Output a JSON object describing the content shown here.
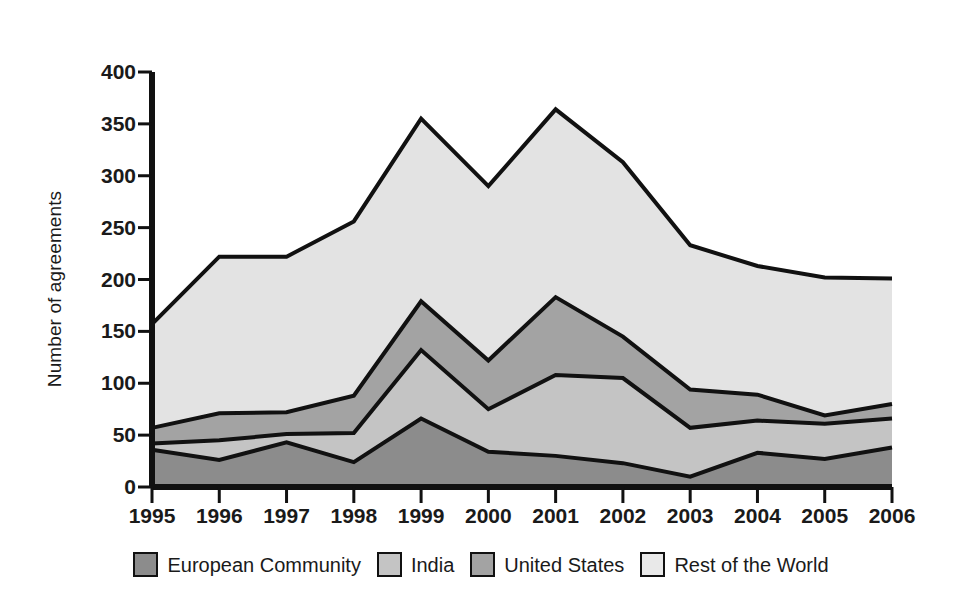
{
  "chart_data": {
    "type": "area",
    "stacked": true,
    "title": "",
    "subtitle": "",
    "xlabel": "",
    "ylabel": "Number of agreements",
    "categories": [
      "1995",
      "1996",
      "1997",
      "1998",
      "1999",
      "2000",
      "2001",
      "2002",
      "2003",
      "2004",
      "2005",
      "2006"
    ],
    "x": [
      1995,
      1996,
      1997,
      1998,
      1999,
      2000,
      2001,
      2002,
      2003,
      2004,
      2005,
      2006
    ],
    "xlim": [
      1995,
      2006
    ],
    "ylim": [
      0,
      400
    ],
    "y_ticks": [
      0,
      50,
      100,
      150,
      200,
      250,
      300,
      350,
      400
    ],
    "x_ticks": [
      1995,
      1996,
      1997,
      1998,
      1999,
      2000,
      2001,
      2002,
      2003,
      2004,
      2005,
      2006
    ],
    "grid": false,
    "legend_position": "bottom",
    "series": [
      {
        "name": "European Community",
        "color": "#8c8c8c",
        "values": [
          36,
          26,
          43,
          24,
          66,
          34,
          30,
          23,
          10,
          33,
          27,
          38
        ]
      },
      {
        "name": "India",
        "color": "#c4c4c4",
        "values": [
          6,
          19,
          8,
          28,
          66,
          41,
          78,
          82,
          47,
          31,
          34,
          28
        ]
      },
      {
        "name": "United States",
        "color": "#a3a3a3",
        "values": [
          15,
          26,
          21,
          36,
          47,
          47,
          75,
          40,
          37,
          25,
          8,
          14
        ]
      },
      {
        "name": "Rest of the World",
        "color": "#e3e3e3",
        "values": [
          100,
          151,
          150,
          168,
          176,
          168,
          181,
          168,
          139,
          124,
          133,
          121
        ]
      }
    ],
    "cumulative_totals": [
      157,
      222,
      222,
      256,
      355,
      290,
      364,
      313,
      233,
      213,
      202,
      201
    ],
    "line_color": "#111111",
    "background_color": "#ffffff"
  },
  "axis": {
    "y_title": "Number of agreements",
    "y_tick_labels": [
      "0",
      "50",
      "100",
      "150",
      "200",
      "250",
      "300",
      "350",
      "400"
    ],
    "x_tick_labels": [
      "1995",
      "1996",
      "1997",
      "1998",
      "1999",
      "2000",
      "2001",
      "2002",
      "2003",
      "2004",
      "2005",
      "2006"
    ]
  },
  "legend": {
    "entries": [
      {
        "label": "European Community",
        "swatch_color": "#8c8c8c"
      },
      {
        "label": "India",
        "swatch_color": "#c4c4c4"
      },
      {
        "label": "United States",
        "swatch_color": "#a3a3a3"
      },
      {
        "label": "Rest of the World",
        "swatch_color": "#e9e9e9"
      }
    ]
  }
}
